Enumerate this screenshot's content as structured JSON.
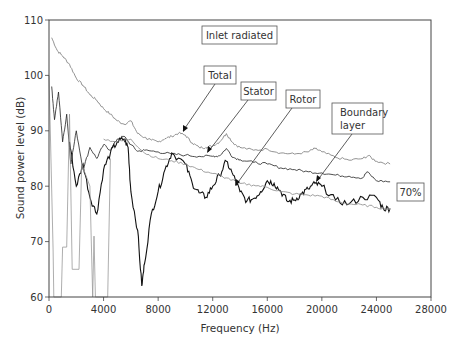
{
  "chart_data": {
    "type": "line",
    "title": "Inlet radiated",
    "xlabel": "Frequency (Hz)",
    "ylabel": "Sound power level (dB)",
    "xlim": [
      0,
      28000
    ],
    "ylim": [
      60,
      110
    ],
    "xticks": [
      0,
      4000,
      8000,
      12000,
      16000,
      20000,
      24000,
      28000
    ],
    "yticks": [
      60,
      70,
      80,
      90,
      100,
      110
    ],
    "grid": false,
    "legend": "callout labels with arrows",
    "annotation": "70%",
    "series": [
      {
        "name": "Total",
        "color": "#777777",
        "points": [
          [
            200,
            106.8
          ],
          [
            600,
            104.5
          ],
          [
            1000,
            103.5
          ],
          [
            1500,
            102
          ],
          [
            2000,
            99.5
          ],
          [
            2500,
            98.2
          ],
          [
            3000,
            96.5
          ],
          [
            3500,
            95.5
          ],
          [
            4000,
            94
          ],
          [
            4500,
            93
          ],
          [
            5000,
            91.8
          ],
          [
            5500,
            91.2
          ],
          [
            6000,
            91.8
          ],
          [
            6500,
            89.5
          ],
          [
            7000,
            88.8
          ],
          [
            7500,
            88.3
          ],
          [
            8000,
            88
          ],
          [
            8500,
            88.6
          ],
          [
            9000,
            89
          ],
          [
            9500,
            89.6
          ],
          [
            10000,
            89.2
          ],
          [
            10500,
            87.8
          ],
          [
            11000,
            87
          ],
          [
            11500,
            87
          ],
          [
            12000,
            87.3
          ],
          [
            12500,
            88
          ],
          [
            13000,
            89.5
          ],
          [
            13500,
            87.8
          ],
          [
            14000,
            87
          ],
          [
            15000,
            86.5
          ],
          [
            16000,
            86.7
          ],
          [
            17000,
            86
          ],
          [
            18000,
            85.8
          ],
          [
            19000,
            86.2
          ],
          [
            19500,
            86.8
          ],
          [
            20000,
            86.2
          ],
          [
            21000,
            85.2
          ],
          [
            22000,
            84.7
          ],
          [
            23000,
            85
          ],
          [
            23400,
            85.5
          ],
          [
            24000,
            84.5
          ],
          [
            25000,
            84
          ]
        ]
      },
      {
        "name": "Stator",
        "color": "#222222",
        "points": [
          [
            200,
            98
          ],
          [
            400,
            92
          ],
          [
            700,
            97
          ],
          [
            1000,
            88
          ],
          [
            1300,
            93
          ],
          [
            1600,
            84
          ],
          [
            2000,
            90
          ],
          [
            2500,
            83
          ],
          [
            3000,
            87
          ],
          [
            3500,
            85
          ],
          [
            4000,
            87.5
          ],
          [
            4500,
            86.5
          ],
          [
            5000,
            88.5
          ],
          [
            5500,
            89
          ],
          [
            6000,
            87.5
          ],
          [
            6500,
            86.3
          ],
          [
            7000,
            86.5
          ],
          [
            8000,
            86.2
          ],
          [
            9000,
            85.8
          ],
          [
            10000,
            85.6
          ],
          [
            11000,
            85.4
          ],
          [
            12000,
            85.4
          ],
          [
            12500,
            85.5
          ],
          [
            13000,
            86.8
          ],
          [
            13500,
            85.2
          ],
          [
            14000,
            84.8
          ],
          [
            15000,
            84.3
          ],
          [
            16000,
            84
          ],
          [
            17000,
            83.3
          ],
          [
            18000,
            83
          ],
          [
            19000,
            82.6
          ],
          [
            20000,
            82.4
          ],
          [
            21000,
            82
          ],
          [
            22000,
            81.8
          ],
          [
            23000,
            81.5
          ],
          [
            23300,
            82.6
          ],
          [
            24000,
            81
          ],
          [
            25000,
            80.8
          ]
        ]
      },
      {
        "name": "Rotor",
        "color": "#111111",
        "points": [
          [
            1500,
            88
          ],
          [
            2000,
            80
          ],
          [
            2500,
            84
          ],
          [
            3000,
            78
          ],
          [
            3500,
            75
          ],
          [
            4000,
            83
          ],
          [
            4500,
            86
          ],
          [
            5000,
            88
          ],
          [
            5500,
            88.5
          ],
          [
            5800,
            87
          ],
          [
            6000,
            79
          ],
          [
            6500,
            72
          ],
          [
            6800,
            62
          ],
          [
            7000,
            66
          ],
          [
            7500,
            75
          ],
          [
            8000,
            79
          ],
          [
            8500,
            83
          ],
          [
            9000,
            86
          ],
          [
            10000,
            84
          ],
          [
            10500,
            80.5
          ],
          [
            11000,
            78.8
          ],
          [
            11500,
            78
          ],
          [
            12000,
            80
          ],
          [
            12500,
            82
          ],
          [
            13000,
            84.5
          ],
          [
            13500,
            82
          ],
          [
            14000,
            79
          ],
          [
            14500,
            77.3
          ],
          [
            15000,
            77.8
          ],
          [
            15500,
            79
          ],
          [
            16000,
            81
          ],
          [
            16500,
            80.5
          ],
          [
            17000,
            79
          ],
          [
            17500,
            77.2
          ],
          [
            18000,
            77.5
          ],
          [
            18500,
            78.6
          ],
          [
            19000,
            79.5
          ],
          [
            19500,
            80.5
          ],
          [
            20000,
            80
          ],
          [
            21000,
            77.5
          ],
          [
            22000,
            76.8
          ],
          [
            23000,
            78
          ],
          [
            24000,
            78
          ],
          [
            24500,
            76
          ],
          [
            25000,
            76
          ]
        ]
      },
      {
        "name": "Boundary layer",
        "color": "#888888",
        "points": [
          [
            4000,
            88.5
          ],
          [
            5000,
            88
          ],
          [
            6000,
            88.5
          ],
          [
            7000,
            86
          ],
          [
            8000,
            85
          ],
          [
            9000,
            84.6
          ],
          [
            10000,
            84
          ],
          [
            11000,
            83
          ],
          [
            12000,
            82.3
          ],
          [
            13000,
            81.5
          ],
          [
            14000,
            80.5
          ],
          [
            15000,
            80.2
          ],
          [
            16000,
            79.8
          ],
          [
            17000,
            79
          ],
          [
            18000,
            78.6
          ],
          [
            19000,
            78.4
          ],
          [
            20000,
            78.2
          ],
          [
            21000,
            77.3
          ],
          [
            22000,
            76.8
          ],
          [
            23000,
            76.6
          ],
          [
            24000,
            76.2
          ],
          [
            25000,
            75.8
          ]
        ]
      },
      {
        "name": "Low-frequency stepped spectrum",
        "color": "#999999",
        "points": [
          [
            0,
            100
          ],
          [
            300,
            68.5
          ],
          [
            350,
            60
          ],
          [
            900,
            60
          ],
          [
            1000,
            69
          ],
          [
            1300,
            69
          ],
          [
            1500,
            93
          ],
          [
            1700,
            65
          ],
          [
            2200,
            65
          ],
          [
            2400,
            84
          ],
          [
            3000,
            80
          ],
          [
            3200,
            60
          ],
          [
            3300,
            71
          ],
          [
            3400,
            60
          ],
          [
            4300,
            60
          ],
          [
            4500,
            85
          ]
        ]
      }
    ]
  },
  "labels": {
    "title_box": "Inlet radiated",
    "total": "Total",
    "stator": "Stator",
    "rotor": "Rotor",
    "boundary_line1": "Boundary",
    "boundary_line2": "layer",
    "percent": "70%",
    "xaxis": "Frequency (Hz)",
    "yaxis": "Sound power level (dB)"
  }
}
